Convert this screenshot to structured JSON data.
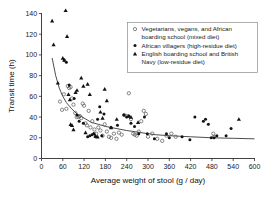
{
  "chart_data": {
    "type": "scatter",
    "title": "",
    "xlabel": "Average weight of stool (g / day)",
    "ylabel": "Transit time (h)",
    "xlim": [
      0,
      600
    ],
    "ylim": [
      0,
      140
    ],
    "xticks": [
      0,
      60,
      120,
      180,
      240,
      300,
      360,
      420,
      480,
      540,
      600
    ],
    "yticks": [
      0,
      20,
      40,
      60,
      80,
      100,
      120,
      140
    ],
    "grid": false,
    "legend_position": "top-right",
    "series": [
      {
        "name": "Vegetarians, vegans, and African boarding school (mixed diet)",
        "marker": "open-circle",
        "color": "#555555",
        "points": [
          [
            52,
            55
          ],
          [
            58,
            47
          ],
          [
            63,
            62
          ],
          [
            70,
            48
          ],
          [
            74,
            70
          ],
          [
            78,
            68
          ],
          [
            82,
            69
          ],
          [
            86,
            58
          ],
          [
            90,
            52
          ],
          [
            95,
            44
          ],
          [
            99,
            40
          ],
          [
            104,
            40
          ],
          [
            108,
            41
          ],
          [
            112,
            39
          ],
          [
            116,
            53
          ],
          [
            120,
            51
          ],
          [
            124,
            34
          ],
          [
            128,
            32
          ],
          [
            133,
            46
          ],
          [
            138,
            30
          ],
          [
            143,
            36
          ],
          [
            149,
            28
          ],
          [
            154,
            24
          ],
          [
            160,
            30
          ],
          [
            166,
            27
          ],
          [
            172,
            22
          ],
          [
            178,
            33
          ],
          [
            184,
            26
          ],
          [
            190,
            21
          ],
          [
            196,
            20
          ],
          [
            204,
            24
          ],
          [
            211,
            19
          ],
          [
            218,
            25
          ],
          [
            226,
            23
          ],
          [
            233,
            42
          ],
          [
            240,
            41
          ],
          [
            246,
            63
          ],
          [
            252,
            38
          ],
          [
            258,
            24
          ],
          [
            263,
            23
          ],
          [
            268,
            22
          ],
          [
            274,
            26
          ],
          [
            281,
            36
          ],
          [
            288,
            46
          ],
          [
            294,
            43
          ],
          [
            300,
            21
          ],
          [
            312,
            24
          ],
          [
            326,
            19
          ],
          [
            340,
            17
          ],
          [
            352,
            22
          ],
          [
            366,
            24
          ],
          [
            378,
            21
          ],
          [
            484,
            24
          ],
          [
            486,
            21
          ]
        ]
      },
      {
        "name": "African villagers (high-residue diet)",
        "marker": "filled-circle",
        "color": "#121212",
        "points": [
          [
            64,
            95
          ],
          [
            70,
            93
          ],
          [
            78,
            71
          ],
          [
            92,
            58
          ],
          [
            100,
            42
          ],
          [
            106,
            36
          ],
          [
            118,
            34
          ],
          [
            130,
            21
          ],
          [
            136,
            22
          ],
          [
            142,
            23
          ],
          [
            148,
            24
          ],
          [
            152,
            21
          ],
          [
            158,
            38
          ],
          [
            164,
            50
          ],
          [
            170,
            22
          ],
          [
            176,
            43
          ],
          [
            196,
            30
          ],
          [
            214,
            32
          ],
          [
            232,
            42
          ],
          [
            240,
            40
          ],
          [
            246,
            41
          ],
          [
            252,
            34
          ],
          [
            262,
            31
          ],
          [
            274,
            24
          ],
          [
            290,
            40
          ],
          [
            298,
            24
          ],
          [
            318,
            19
          ],
          [
            352,
            24
          ],
          [
            360,
            20
          ],
          [
            396,
            21
          ],
          [
            418,
            18
          ],
          [
            432,
            40
          ],
          [
            456,
            36
          ],
          [
            462,
            38
          ],
          [
            470,
            33
          ],
          [
            478,
            20
          ],
          [
            486,
            20
          ],
          [
            494,
            22
          ],
          [
            520,
            22
          ],
          [
            534,
            29
          ]
        ]
      },
      {
        "name": "English boarding school and British Navy (low-residue diet)",
        "marker": "filled-triangle",
        "color": "#121212",
        "points": [
          [
            30,
            133
          ],
          [
            34,
            110
          ],
          [
            46,
            73
          ],
          [
            60,
            97
          ],
          [
            64,
            95
          ],
          [
            68,
            143
          ],
          [
            72,
            118
          ],
          [
            76,
            62
          ],
          [
            80,
            57
          ],
          [
            82,
            33
          ],
          [
            86,
            32
          ],
          [
            90,
            28
          ],
          [
            96,
            64
          ],
          [
            100,
            66
          ],
          [
            112,
            78
          ],
          [
            118,
            70
          ],
          [
            124,
            25
          ],
          [
            130,
            72
          ],
          [
            136,
            62
          ],
          [
            146,
            24
          ],
          [
            152,
            22
          ],
          [
            158,
            21
          ],
          [
            166,
            45
          ],
          [
            172,
            39
          ],
          [
            178,
            67
          ],
          [
            184,
            56
          ],
          [
            196,
            30
          ],
          [
            212,
            38
          ],
          [
            246,
            41
          ],
          [
            252,
            40
          ],
          [
            272,
            35
          ],
          [
            556,
            38
          ]
        ]
      }
    ],
    "fit_curve": {
      "name": "fitted decay curve",
      "color": "#3a3a3a",
      "points": [
        [
          30,
          97
        ],
        [
          40,
          80
        ],
        [
          50,
          68
        ],
        [
          60,
          60
        ],
        [
          70,
          54
        ],
        [
          85,
          48
        ],
        [
          100,
          43
        ],
        [
          120,
          39
        ],
        [
          140,
          35
        ],
        [
          160,
          33
        ],
        [
          180,
          31
        ],
        [
          210,
          29
        ],
        [
          240,
          27
        ],
        [
          280,
          25
        ],
        [
          320,
          23
        ],
        [
          360,
          22
        ],
        [
          420,
          21
        ],
        [
          480,
          20
        ],
        [
          540,
          19.5
        ],
        [
          600,
          19
        ]
      ]
    }
  },
  "legend": {
    "entries": [
      {
        "marker": "open-circle",
        "line1": "Vegetarians, vegans, and African",
        "line2": "boarding school (mixed diet)"
      },
      {
        "marker": "filled-circle",
        "line1": "African villagers (high-residue diet)",
        "line2": ""
      },
      {
        "marker": "filled-triangle",
        "line1": "English boarding school and British",
        "line2": "Navy (low-residue diet)"
      }
    ]
  }
}
